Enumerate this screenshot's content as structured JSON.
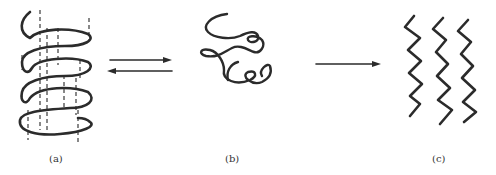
{
  "figure": {
    "panels": [
      {
        "id": "a",
        "label": "(a)",
        "depiction": "alpha helix with dashed vertical guide lines"
      },
      {
        "id": "b",
        "label": "(b)",
        "depiction": "random coil"
      },
      {
        "id": "c",
        "label": "(c)",
        "depiction": "three parallel zigzag extended chains"
      }
    ],
    "arrows": [
      {
        "from": "a",
        "to": "b",
        "type": "reversible equilibrium"
      },
      {
        "from": "b",
        "to": "c",
        "type": "forward"
      }
    ],
    "colors": {
      "ink": "#2b2b2b",
      "background": "#ffffff"
    }
  }
}
